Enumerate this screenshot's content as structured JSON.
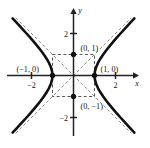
{
  "chart_data": {
    "type": "line",
    "title": "",
    "subtitle": "",
    "xlabel": "x",
    "ylabel": "y",
    "xlim": [
      -2.9,
      2.9
    ],
    "ylim": [
      -2.9,
      2.9
    ],
    "grid": false,
    "legend": null,
    "equation": "x^2 - y^2 = 1",
    "x_ticks": [
      {
        "value": -2,
        "label": "−2"
      },
      {
        "value": 2,
        "label": "2"
      }
    ],
    "y_ticks": [
      {
        "value": 2,
        "label": "2"
      },
      {
        "value": -2,
        "label": "−2"
      }
    ],
    "series": [
      {
        "name": "hyperbola-right-branch",
        "style": "solid",
        "color": "#111111",
        "width": 2.6,
        "points": [
          [
            1.0,
            0.0
          ],
          [
            1.02,
            0.2
          ],
          [
            1.08,
            0.4
          ],
          [
            1.166,
            0.6
          ],
          [
            1.28,
            0.8
          ],
          [
            1.414,
            1.0
          ],
          [
            1.562,
            1.2
          ],
          [
            1.72,
            1.4
          ],
          [
            1.887,
            1.6
          ],
          [
            2.06,
            1.8
          ],
          [
            2.236,
            2.0
          ],
          [
            2.417,
            2.2
          ],
          [
            2.6,
            2.4
          ],
          [
            2.786,
            2.6
          ],
          [
            2.9,
            2.72
          ]
        ]
      },
      {
        "name": "hyperbola-left-branch",
        "style": "solid",
        "color": "#111111",
        "width": 2.6,
        "points": [
          [
            -1.0,
            0.0
          ],
          [
            -1.02,
            0.2
          ],
          [
            -1.08,
            0.4
          ],
          [
            -1.166,
            0.6
          ],
          [
            -1.28,
            0.8
          ],
          [
            -1.414,
            1.0
          ],
          [
            -1.562,
            1.2
          ],
          [
            -1.72,
            1.4
          ],
          [
            -1.887,
            1.6
          ],
          [
            -2.06,
            1.8
          ],
          [
            -2.236,
            2.0
          ],
          [
            -2.417,
            2.2
          ],
          [
            -2.6,
            2.4
          ],
          [
            -2.786,
            2.6
          ],
          [
            -2.9,
            2.72
          ]
        ]
      },
      {
        "name": "asymptote-positive",
        "style": "dashed",
        "color": "#8a8a8a",
        "width": 1,
        "points": [
          [
            -2.75,
            -2.75
          ],
          [
            2.75,
            2.75
          ]
        ]
      },
      {
        "name": "asymptote-negative",
        "style": "dashed",
        "color": "#8a8a8a",
        "width": 1,
        "points": [
          [
            -2.75,
            2.75
          ],
          [
            2.75,
            -2.75
          ]
        ]
      }
    ],
    "reference_box": {
      "name": "central-rectangle",
      "style": "dashed",
      "color": "#555555",
      "x0": -1,
      "y0": -1,
      "x1": 1,
      "y1": 1
    },
    "marked_points": [
      {
        "name": "point-0-1",
        "x": 0,
        "y": 1,
        "label": "(0, 1)",
        "label_dx": 7,
        "label_dy": -4,
        "filled": true
      },
      {
        "name": "point-0-neg1",
        "x": 0,
        "y": -1,
        "label": "(0, −1)",
        "label_dx": 7,
        "label_dy": 12,
        "filled": true
      },
      {
        "name": "point-1-0",
        "x": 1,
        "y": 0,
        "label": "(1, 0)",
        "label_dx": 6,
        "label_dy": -4,
        "filled": true
      },
      {
        "name": "point-neg1-0",
        "x": -1,
        "y": 0,
        "label": "(−1, 0)",
        "label_dx": -36,
        "label_dy": -4,
        "filled": true
      }
    ]
  },
  "figure": {
    "background": "#ffffff",
    "axis_color": "#222222",
    "curve_color": "#111111",
    "asymptote_color": "#8a8a8a",
    "box_color": "#555555"
  }
}
